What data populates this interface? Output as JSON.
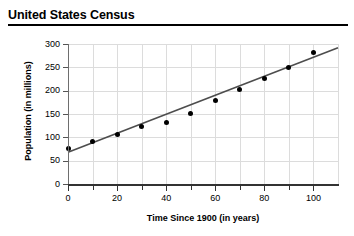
{
  "chart_data": {
    "type": "scatter",
    "title": "United States Census",
    "xlabel": "Time Since 1900 (in years)",
    "ylabel": "Population (in millions)",
    "xlim": [
      0,
      110
    ],
    "ylim": [
      0,
      300
    ],
    "grid": true,
    "legend": "none",
    "x_major_ticks": [
      0,
      20,
      40,
      60,
      80,
      100
    ],
    "x_minor_ticks": [
      10,
      30,
      50,
      70,
      90
    ],
    "x_tick_labels": [
      "0",
      "20",
      "40",
      "60",
      "80",
      "100"
    ],
    "y_ticks": [
      0,
      50,
      100,
      150,
      200,
      250,
      300
    ],
    "y_tick_labels": [
      "0",
      "50",
      "100",
      "150",
      "200",
      "250",
      "300"
    ],
    "x": [
      0,
      10,
      20,
      30,
      40,
      50,
      60,
      70,
      80,
      90,
      100
    ],
    "values": [
      76,
      92,
      106,
      123,
      132,
      151,
      179,
      203,
      227,
      250,
      281
    ],
    "series": [
      {
        "name": "US population",
        "marker": "filled-circle",
        "color": "#000000",
        "points": [
          {
            "x": 0,
            "y": 76
          },
          {
            "x": 10,
            "y": 92
          },
          {
            "x": 20,
            "y": 106
          },
          {
            "x": 30,
            "y": 123
          },
          {
            "x": 40,
            "y": 132
          },
          {
            "x": 50,
            "y": 151
          },
          {
            "x": 60,
            "y": 179
          },
          {
            "x": 70,
            "y": 203
          },
          {
            "x": 80,
            "y": 227
          },
          {
            "x": 90,
            "y": 250
          },
          {
            "x": 100,
            "y": 281
          }
        ]
      }
    ],
    "trendline": {
      "name": "line of best fit",
      "color": "#4d4d4d",
      "x_start": 0,
      "y_start": 68,
      "x_end": 110,
      "y_end": 292
    },
    "colors": {
      "marker": "#000000",
      "trendline": "#4d4d4d",
      "gridline": "#dcdcdc",
      "axis": "#333333",
      "title_rule": "#000000"
    }
  }
}
